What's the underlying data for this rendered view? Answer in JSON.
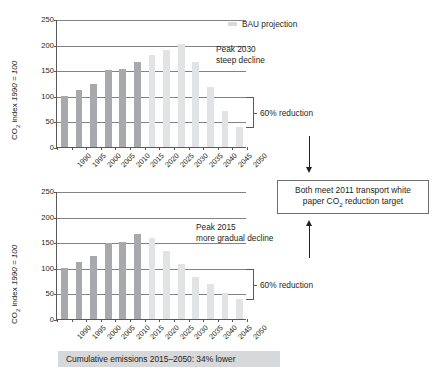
{
  "figure": {
    "legend_label": "BAU projection",
    "caption": "Cumulative emissions 2015–2050: 34% lower",
    "center_box_line1": "Both meet 2011 transport white",
    "center_box_line2_pre": "paper CO",
    "center_box_line2_sub": "2",
    "center_box_line2_post": " reduction target",
    "reduction_label_top": "60% reduction",
    "reduction_label_bottom": "60% reduction",
    "axis_title_pre": "CO",
    "axis_title_sub": "2",
    "axis_title_post": " index ",
    "axis_title_italic": "1990 = 100"
  },
  "chart_data": [
    {
      "id": "top",
      "type": "bar",
      "title": "",
      "annotation_line1": "Peak 2030",
      "annotation_line2": "steep decline",
      "xlabel": "",
      "ylabel": "CO2 index 1990 = 100",
      "ylim": [
        0,
        250
      ],
      "yticks": [
        0,
        50,
        100,
        150,
        200,
        250
      ],
      "grid": true,
      "legend_position": "top-right",
      "categories": [
        "1990",
        "1995",
        "2000",
        "2005",
        "2010",
        "2015",
        "2020",
        "2025",
        "2030",
        "2035",
        "2040",
        "2045",
        "2050"
      ],
      "values": [
        100,
        112,
        124,
        150,
        153,
        166,
        179,
        190,
        201,
        166,
        117,
        70,
        40
      ],
      "series_kinds": [
        "historic",
        "historic",
        "historic",
        "historic",
        "historic",
        "historic",
        "bau",
        "bau",
        "bau",
        "bau",
        "bau",
        "bau",
        "bau"
      ],
      "reduction_from": 100,
      "reduction_to": 40
    },
    {
      "id": "bottom",
      "type": "bar",
      "title": "",
      "annotation_line1": "Peak 2015",
      "annotation_line2": "more gradual decline",
      "xlabel": "",
      "ylabel": "CO2 index 1990 = 100",
      "ylim": [
        0,
        250
      ],
      "yticks": [
        0,
        50,
        100,
        150,
        200,
        250
      ],
      "grid": true,
      "legend_position": "none",
      "categories": [
        "1990",
        "1995",
        "2000",
        "2005",
        "2010",
        "2015",
        "2020",
        "2025",
        "2030",
        "2035",
        "2040",
        "2045",
        "2050"
      ],
      "values": [
        100,
        111,
        124,
        148,
        151,
        166,
        159,
        133,
        107,
        82,
        68,
        50,
        40
      ],
      "series_kinds": [
        "historic",
        "historic",
        "historic",
        "historic",
        "historic",
        "historic",
        "bau",
        "bau",
        "bau",
        "bau",
        "bau",
        "bau",
        "bau"
      ],
      "reduction_from": 100,
      "reduction_to": 40
    }
  ],
  "colors": {
    "historic_bar": "#a7a9ac",
    "bau_bar": "#e2e3e4",
    "gridline": "#808285",
    "axis": "#58595b",
    "caption_bg": "#d7d8da",
    "text": "#231f20"
  }
}
